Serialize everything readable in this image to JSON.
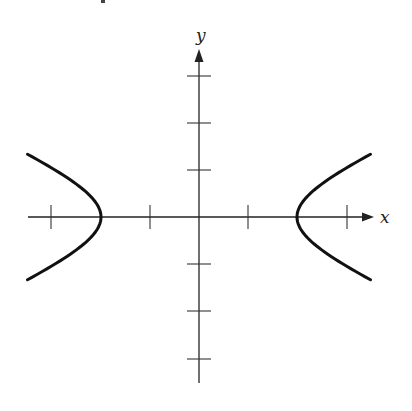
{
  "diagram": {
    "type": "hyperbola-graph",
    "equation_shape": "x^2/a^2 - y^2/b^2 = 1",
    "axes": {
      "x_label": "x",
      "y_label": "y",
      "x_ticks": [
        -3,
        -1,
        1,
        3
      ],
      "y_ticks": [
        -3,
        -2,
        -1,
        1,
        2,
        3
      ]
    },
    "curve": {
      "a": 2,
      "b": 1,
      "vertices": [
        [
          -2,
          0
        ],
        [
          2,
          0
        ]
      ],
      "x_extent": 3.5
    },
    "colors": {
      "curve": "#111111",
      "axis": "#222222",
      "background": "#ffffff"
    }
  }
}
